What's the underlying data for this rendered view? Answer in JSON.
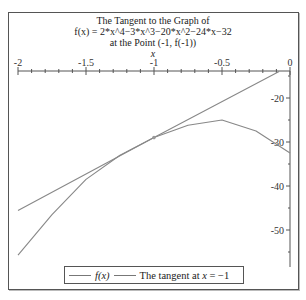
{
  "chart_data": {
    "type": "line",
    "title": "The Tangent to the Graph of",
    "subtitle": "f(x) = 2*x^4−3*x^3−20*x^2−24*x−32",
    "subtitle2": "at the Point (-1, f(-1))",
    "xlabel": "x",
    "ylabel": "",
    "xlim": [
      -2,
      0
    ],
    "ylim": [
      -56,
      -14
    ],
    "x_ticks": [
      "-2",
      "-1.5",
      "-1",
      "-0.5",
      "0"
    ],
    "y_ticks": [
      "-20",
      "-30",
      "-40",
      "-50"
    ],
    "x_axis_position": "top",
    "y_axis_position": "right",
    "grid": false,
    "legend_position": "bottom",
    "series": [
      {
        "name": "f(x)",
        "x": [
          -2,
          -1.75,
          -1.5,
          -1.25,
          -1,
          -0.75,
          -0.5,
          -0.25,
          0
        ],
        "values": [
          -55.7,
          -46.5,
          -38.5,
          -33,
          -29,
          -26.2,
          -25,
          -27.5,
          -32.5
        ]
      },
      {
        "name": "The tangent at x = -1",
        "x": [
          -2,
          -1,
          -0.08
        ],
        "values": [
          -45.6,
          -29,
          -14
        ]
      }
    ],
    "annotations": [
      {
        "type": "point",
        "x": -1,
        "y": -29,
        "label": "tangent point"
      }
    ]
  },
  "title": {
    "line1": "The Tangent to the Graph of",
    "line2": "f(x) = 2*x^4−3*x^3−20*x^2−24*x−32",
    "line3": "at the Point (-1, f(-1))",
    "xlabel": "x"
  },
  "axes": {
    "x_ticks": [
      {
        "label": "-2",
        "px": 18
      },
      {
        "label": "-1.5",
        "px": 86
      },
      {
        "label": "-1",
        "px": 154
      },
      {
        "label": "-0.5",
        "px": 222
      },
      {
        "label": "0",
        "px": 290
      }
    ],
    "y_ticks": [
      {
        "label": "-20",
        "py": 98
      },
      {
        "label": "-30",
        "py": 142
      },
      {
        "label": "-40",
        "py": 186
      },
      {
        "label": "-50",
        "py": 230
      }
    ]
  },
  "legend": {
    "item1_label": "f(x)",
    "item2_prefix": "The tangent at ",
    "item2_var": "x",
    "item2_suffix": " = −1"
  }
}
